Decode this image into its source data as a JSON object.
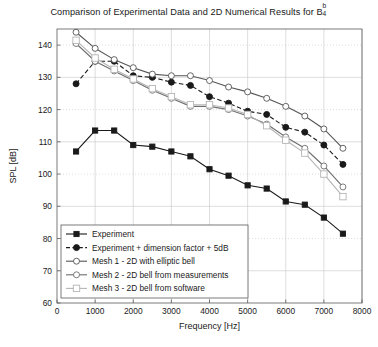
{
  "figure": {
    "title_main": "Comparison of Experimental Data and 2D Numerical Results for B",
    "title_sup": "b",
    "title_sub": "4"
  },
  "chart_data": {
    "type": "line",
    "xlabel": "Frequency [Hz]",
    "ylabel": "SPL [dB]",
    "xlim": [
      0,
      8000
    ],
    "ylim": [
      60,
      145
    ],
    "xticks": [
      0,
      1000,
      2000,
      3000,
      4000,
      5000,
      6000,
      7000,
      8000
    ],
    "xtick_labels": [
      "0",
      "1000",
      "2000",
      "3000",
      "4000",
      "5000",
      "6000",
      "7000",
      "8000"
    ],
    "yticks": [
      60,
      70,
      80,
      90,
      100,
      110,
      120,
      130,
      140
    ],
    "ytick_labels": [
      "60",
      "70",
      "80",
      "90",
      "100",
      "110",
      "120",
      "130",
      "140"
    ],
    "grid": true,
    "legend_position": "lower-left",
    "series": [
      {
        "name": "Experiment",
        "color": "#1a1a1a",
        "dash": "none",
        "marker": "square",
        "marker_size": 2.6,
        "line_width": 1.1,
        "x": [
          500,
          1000,
          1500,
          2000,
          2500,
          3000,
          3500,
          4000,
          4500,
          5000,
          5500,
          6000,
          6500,
          7000,
          7500
        ],
        "y": [
          107.0,
          113.5,
          113.5,
          109.0,
          108.5,
          107.0,
          105.5,
          101.5,
          99.5,
          96.5,
          95.5,
          91.5,
          90.5,
          86.5,
          81.5
        ]
      },
      {
        "name": "Experiment + dimension factor + 5dB",
        "color": "#1a1a1a",
        "dash": "dashed",
        "marker": "circle",
        "marker_size": 3.0,
        "line_width": 1.1,
        "x": [
          500,
          1000,
          1500,
          2000,
          2500,
          3000,
          3500,
          4000,
          4500,
          5000,
          5500,
          6000,
          6500,
          7000,
          7500
        ],
        "y": [
          128.0,
          135.0,
          135.0,
          130.5,
          130.0,
          128.5,
          127.5,
          124.0,
          122.0,
          119.5,
          118.5,
          114.5,
          113.0,
          109.0,
          103.0
        ]
      },
      {
        "name": "Mesh 1 - 2D with elliptic bell",
        "color": "#555555",
        "dash": "none",
        "marker": "circle",
        "marker_size": 3.0,
        "line_width": 1.1,
        "x": [
          500,
          1000,
          1500,
          2000,
          2500,
          3000,
          3500,
          4000,
          4500,
          5000,
          5500,
          6000,
          6500,
          7000,
          7500
        ],
        "y": [
          144.0,
          139.0,
          135.5,
          133.0,
          131.0,
          130.5,
          130.5,
          129.0,
          127.0,
          125.5,
          123.5,
          121.0,
          118.0,
          114.0,
          108.0
        ]
      },
      {
        "name": "Mesh 2 - 2D bell from measurements",
        "color": "#6e6e6e",
        "dash": "none",
        "marker": "circle",
        "marker_size": 3.0,
        "line_width": 1.1,
        "x": [
          500,
          1000,
          1500,
          2000,
          2500,
          3000,
          3500,
          4000,
          4500,
          5000,
          5500,
          6000,
          6500,
          7000,
          7500
        ],
        "y": [
          140.5,
          135.0,
          132.0,
          129.0,
          126.0,
          123.5,
          121.0,
          121.0,
          120.0,
          118.0,
          115.5,
          111.5,
          108.0,
          102.5,
          96.0
        ]
      },
      {
        "name": "Mesh 3 - 2D bell from software",
        "color": "#b5b5b5",
        "dash": "none",
        "marker": "square",
        "marker_size": 3.2,
        "line_width": 1.1,
        "x": [
          500,
          1000,
          1500,
          2000,
          2500,
          3000,
          3500,
          4000,
          4500,
          5000,
          5500,
          6000,
          6500,
          7000,
          7500
        ],
        "y": [
          141.5,
          136.0,
          132.5,
          129.5,
          126.5,
          124.0,
          121.5,
          121.5,
          120.5,
          118.5,
          115.0,
          110.5,
          106.5,
          100.0,
          93.0
        ]
      }
    ]
  }
}
